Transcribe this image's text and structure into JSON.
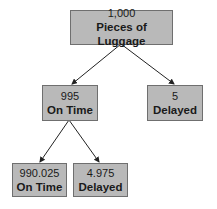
{
  "diagram": {
    "type": "probability-tree",
    "root": {
      "value": "1,000",
      "label": "Pieces of Luggage"
    },
    "level1": [
      {
        "value": "995",
        "label": "On Time"
      },
      {
        "value": "5",
        "label": "Delayed"
      }
    ],
    "level2": [
      {
        "value": "990.025",
        "label": "On Time"
      },
      {
        "value": "4.975",
        "label": "Delayed"
      }
    ],
    "colors": {
      "box_fill": "#b9b9b9",
      "box_border": "#6f6f6f",
      "arrow": "#222222"
    }
  }
}
